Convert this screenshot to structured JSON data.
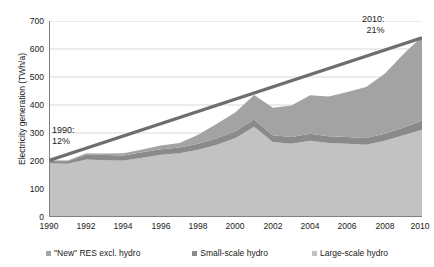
{
  "chart_data": {
    "type": "area",
    "title": "",
    "subtitle": "",
    "xlabel": "",
    "ylabel": "Electricity generation (TWh/a)",
    "xlim": [
      1990,
      2010
    ],
    "ylim": [
      0,
      700
    ],
    "ytick_values": [
      0,
      100,
      200,
      300,
      400,
      500,
      600,
      700
    ],
    "ytick_labels": [
      "0",
      "100",
      "200",
      "300",
      "400",
      "500",
      "600",
      "700"
    ],
    "xtick_values": [
      1990,
      1992,
      1994,
      1996,
      1998,
      2000,
      2002,
      2004,
      2006,
      2008,
      2010
    ],
    "xtick_labels": [
      "1990",
      "1992",
      "1994",
      "1996",
      "1998",
      "2000",
      "2002",
      "2004",
      "2006",
      "2008",
      "2010"
    ],
    "grid": "horizontal",
    "stacked": true,
    "legend_position": "bottom",
    "x": [
      1990,
      1991,
      1992,
      1993,
      1994,
      1995,
      1996,
      1997,
      1998,
      1999,
      2000,
      2001,
      2002,
      2003,
      2004,
      2005,
      2006,
      2007,
      2008,
      2009,
      2010
    ],
    "series": [
      {
        "name": "Large-scale hydro",
        "color": "#c2c2c2",
        "values": [
          192,
          190,
          205,
          203,
          202,
          212,
          222,
          228,
          240,
          258,
          282,
          322,
          268,
          262,
          272,
          264,
          262,
          258,
          272,
          292,
          312
        ]
      },
      {
        "name": "Small-scale hydro",
        "color": "#8a8a8a",
        "values": [
          8,
          9,
          18,
          18,
          18,
          19,
          20,
          20,
          22,
          23,
          24,
          26,
          24,
          24,
          25,
          24,
          24,
          24,
          25,
          27,
          33
        ]
      },
      {
        "name": "\"New\" RES excl. hydro",
        "color": "#a3a3a3",
        "values": [
          2,
          3,
          5,
          6,
          8,
          10,
          13,
          16,
          32,
          52,
          68,
          88,
          98,
          112,
          138,
          142,
          160,
          182,
          215,
          262,
          300
        ]
      }
    ],
    "trend_line": {
      "name": "RES share target path",
      "color": "#6e6e6e",
      "x": [
        1990,
        2010
      ],
      "values": [
        202,
        640
      ]
    },
    "annotations": [
      {
        "name": "start-share",
        "line1": "1990:",
        "line2": "12%"
      },
      {
        "name": "end-share",
        "line1": "2010:",
        "line2": "21%"
      }
    ],
    "legend": [
      {
        "label": "\"New\" RES excl. hydro",
        "color": "#a3a3a3"
      },
      {
        "label": "Small-scale hydro",
        "color": "#8a8a8a"
      },
      {
        "label": "Large-scale hydro",
        "color": "#c2c2c2"
      }
    ],
    "colors": {
      "axis": "#808080",
      "grid": "#d9d9d9",
      "text": "#1a1a1a",
      "background": "#ffffff"
    }
  }
}
